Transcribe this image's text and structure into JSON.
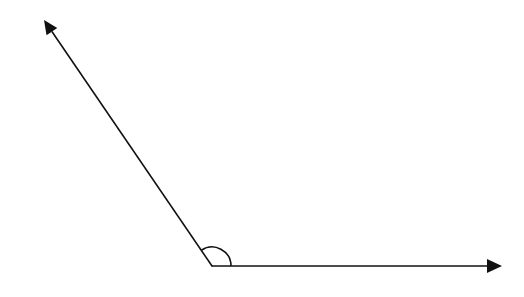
{
  "diagram": {
    "type": "angle",
    "stroke_color": "#111111",
    "background": "#ffffff",
    "vertex": {
      "x": 212,
      "y": 266
    },
    "rays": [
      {
        "name": "left-ray",
        "tip": {
          "x": 44,
          "y": 20
        }
      },
      {
        "name": "right-ray",
        "tip": {
          "x": 502,
          "y": 266
        }
      }
    ],
    "angle_arc": {
      "radius": 19
    }
  }
}
